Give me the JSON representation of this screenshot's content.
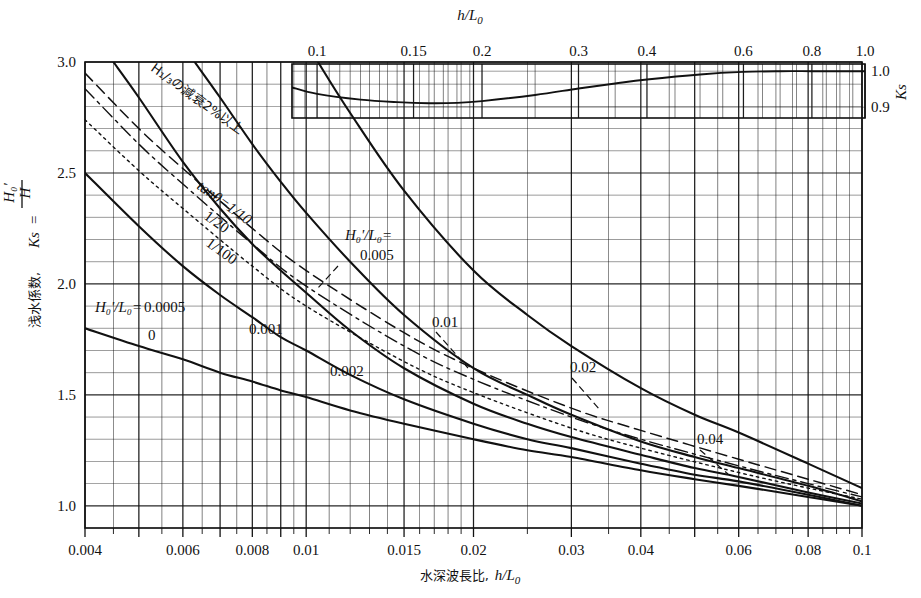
{
  "figure": {
    "kind": "engineering-nomograph",
    "background": "#ffffff",
    "ink": "#111111"
  },
  "main_axes": {
    "x_title_jp": "水深波長比,",
    "x_title_sym": "h/L",
    "x_title_sub": "0",
    "y_title_jp": "浅水係数,",
    "y_title_sym": "Ks",
    "y_title_frac_num": "H",
    "y_title_frac_den": "H₀'",
    "x_ticks": [
      "0.004",
      "0.006",
      "0.008",
      "0.01",
      "0.015",
      "0.02",
      "0.03",
      "0.04",
      "0.06",
      "0.08",
      "0.1"
    ],
    "y_ticks": [
      "1.0",
      "1.5",
      "2.0",
      "2.5",
      "3.0"
    ]
  },
  "inset_axes": {
    "x_title_sym": "h/L",
    "x_title_sub": "0",
    "y_title_sym": "Ks",
    "x_ticks": [
      "0.1",
      "0.15",
      "0.2",
      "0.3",
      "0.4",
      "0.6",
      "0.8",
      "1.0"
    ],
    "y_ticks": [
      "1.0",
      "0.9"
    ]
  },
  "annotations": {
    "wave_decay_note": "H₁/₃の減衰2%以上",
    "slope_prefix": "tanθ=",
    "slope_1_10": "1/10",
    "slope_1_20": "1/20",
    "slope_1_100": "1/100",
    "series_title_left": "H₀'/L₀=",
    "series_title_right": "H₀'/L₀="
  },
  "curve_labels": {
    "l_0005": "0.0005",
    "l_0": "0",
    "l_001": "0.001",
    "l_002": "0.002",
    "l_005": "0.005",
    "l_01": "0.01",
    "l_02": "0.02",
    "l_04": "0.04"
  },
  "chart_data": {
    "type": "line",
    "xlabel": "h/L0",
    "ylabel": "Ks = H/H0'",
    "xscale": "log",
    "xlim": [
      0.004,
      0.1
    ],
    "ylim": [
      0.9,
      3.0
    ],
    "grid": true,
    "legend": "inline-curve-labels",
    "x_tick_values": [
      0.004,
      0.006,
      0.008,
      0.01,
      0.015,
      0.02,
      0.03,
      0.04,
      0.06,
      0.08,
      0.1
    ],
    "y_tick_values": [
      1.0,
      1.5,
      2.0,
      2.5,
      3.0
    ],
    "series": [
      {
        "name": "H0'/L0 = 0",
        "style": "solid",
        "x": [
          0.004,
          0.005,
          0.006,
          0.007,
          0.008,
          0.009,
          0.01,
          0.012,
          0.015,
          0.02,
          0.025,
          0.03,
          0.04,
          0.05,
          0.06,
          0.08,
          0.1
        ],
        "values": [
          1.8,
          1.72,
          1.66,
          1.6,
          1.56,
          1.52,
          1.49,
          1.43,
          1.37,
          1.3,
          1.25,
          1.22,
          1.16,
          1.12,
          1.09,
          1.04,
          1.0
        ]
      },
      {
        "name": "H0'/L0 = 0.0005",
        "style": "solid",
        "x": [
          0.004,
          0.005,
          0.006,
          0.007,
          0.008,
          0.009,
          0.01,
          0.012,
          0.015,
          0.02,
          0.025,
          0.03,
          0.04,
          0.05,
          0.06,
          0.08,
          0.1
        ],
        "values": [
          2.5,
          2.26,
          2.08,
          1.95,
          1.85,
          1.76,
          1.7,
          1.59,
          1.48,
          1.37,
          1.3,
          1.26,
          1.19,
          1.14,
          1.11,
          1.05,
          1.0
        ]
      },
      {
        "name": "H0'/L0 = 0.001",
        "style": "solid",
        "x": [
          0.0045,
          0.005,
          0.006,
          0.007,
          0.008,
          0.009,
          0.01,
          0.012,
          0.015,
          0.02,
          0.025,
          0.03,
          0.04,
          0.05,
          0.06,
          0.08,
          0.1
        ],
        "values": [
          3.0,
          2.84,
          2.55,
          2.34,
          2.18,
          2.06,
          1.96,
          1.79,
          1.62,
          1.46,
          1.37,
          1.31,
          1.23,
          1.17,
          1.13,
          1.06,
          1.01
        ]
      },
      {
        "name": "H0'/L0 = 0.002",
        "style": "solid",
        "x": [
          0.0063,
          0.007,
          0.008,
          0.009,
          0.01,
          0.012,
          0.015,
          0.02,
          0.025,
          0.03,
          0.04,
          0.05,
          0.06,
          0.08,
          0.1
        ],
        "values": [
          3.0,
          2.84,
          2.63,
          2.46,
          2.32,
          2.1,
          1.86,
          1.62,
          1.5,
          1.41,
          1.29,
          1.22,
          1.17,
          1.09,
          1.02
        ]
      },
      {
        "name": "H0'/L0 = 0.005",
        "style": "solid",
        "x": [
          0.0105,
          0.012,
          0.015,
          0.02,
          0.025,
          0.03,
          0.04,
          0.05,
          0.06,
          0.08,
          0.1
        ],
        "values": [
          3.0,
          2.77,
          2.42,
          2.06,
          1.86,
          1.72,
          1.53,
          1.41,
          1.33,
          1.19,
          1.08
        ]
      },
      {
        "name": "tanθ = 1/10",
        "style": "dashed",
        "x": [
          0.004,
          0.005,
          0.006,
          0.008,
          0.01,
          0.015,
          0.02,
          0.03,
          0.04,
          0.06,
          0.08,
          0.1
        ],
        "values": [
          2.95,
          2.7,
          2.52,
          2.25,
          2.06,
          1.78,
          1.62,
          1.44,
          1.34,
          1.21,
          1.12,
          1.05
        ]
      },
      {
        "name": "tanθ = 1/20",
        "style": "dash-dot",
        "x": [
          0.004,
          0.005,
          0.006,
          0.008,
          0.01,
          0.015,
          0.02,
          0.03,
          0.04,
          0.06,
          0.08,
          0.1
        ],
        "values": [
          2.88,
          2.63,
          2.45,
          2.18,
          1.99,
          1.72,
          1.57,
          1.4,
          1.3,
          1.18,
          1.1,
          1.04
        ]
      },
      {
        "name": "tanθ = 1/100",
        "style": "dotted",
        "x": [
          0.004,
          0.005,
          0.006,
          0.008,
          0.01,
          0.015,
          0.02,
          0.03,
          0.04,
          0.06,
          0.08,
          0.1
        ],
        "values": [
          2.74,
          2.51,
          2.34,
          2.08,
          1.9,
          1.65,
          1.51,
          1.35,
          1.26,
          1.15,
          1.08,
          1.03
        ]
      }
    ]
  },
  "inset_chart_data": {
    "type": "line",
    "xlabel": "h/L0",
    "ylabel": "Ks",
    "xscale": "log",
    "xlim": [
      0.09,
      1.0
    ],
    "ylim": [
      0.87,
      1.02
    ],
    "grid": true,
    "x_tick_values": [
      0.1,
      0.15,
      0.2,
      0.3,
      0.4,
      0.6,
      0.8,
      1.0
    ],
    "y_tick_values": [
      0.9,
      1.0
    ],
    "series": [
      {
        "name": "Ks (linear wave theory)",
        "style": "solid",
        "x": [
          0.09,
          0.1,
          0.12,
          0.14,
          0.16,
          0.18,
          0.2,
          0.25,
          0.3,
          0.35,
          0.4,
          0.5,
          0.6,
          0.7,
          0.8,
          0.9,
          1.0
        ],
        "values": [
          0.955,
          0.937,
          0.921,
          0.914,
          0.911,
          0.912,
          0.917,
          0.934,
          0.952,
          0.966,
          0.977,
          0.991,
          0.998,
          1.0,
          1.0,
          1.0,
          1.0
        ]
      }
    ]
  }
}
